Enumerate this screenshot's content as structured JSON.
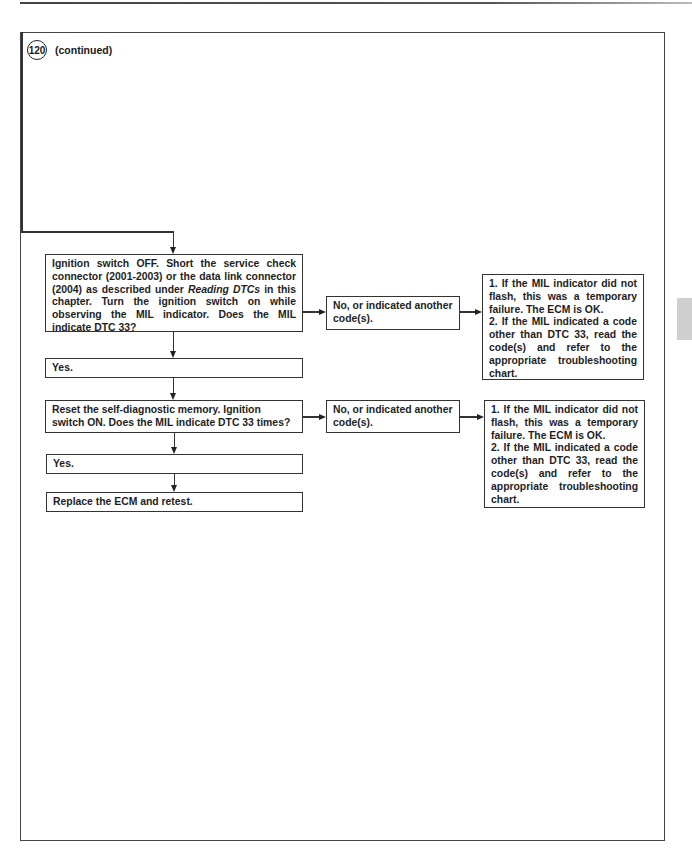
{
  "header": {
    "figure_number": "120",
    "continued_label": "(continued)"
  },
  "flowchart": {
    "step1": {
      "text_before": "Ignition switch OFF. Short the service check connector (2001-2003) or the data link connector (2004) as described under ",
      "emphasis": "Reading DTCs",
      "text_after": " in this chapter. Turn the ignition switch on while observing the MIL indicator. Does the MIL indicate DTC 33?"
    },
    "step1_no": "No, or indicated another code(s).",
    "step1_result": {
      "item1": "1. If the MIL indicator did not flash, this was a temporary failure. The ECM is OK.",
      "item2": "2. If the MIL indicated a code other than DTC 33, read the code(s) and refer to the appropriate troubleshooting chart."
    },
    "step1_yes": "Yes.",
    "step2": "Reset the self-diagnostic memory. Ignition switch ON. Does the MIL indicate DTC 33 times?",
    "step2_no": "No, or indicated another code(s).",
    "step2_result": {
      "item1": "1. If the MIL indicator did not flash, this was a temporary failure. The ECM is OK.",
      "item2": "2. If the MIL indicated a code other than DTC 33, read the code(s) and refer to the appropriate troubleshooting chart."
    },
    "step2_yes": "Yes.",
    "final": "Replace the ECM and retest."
  },
  "colors": {
    "line": "#333333",
    "side_tab": "#cfcfcf"
  }
}
